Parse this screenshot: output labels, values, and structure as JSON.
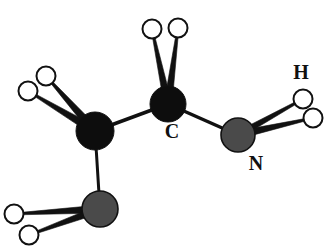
{
  "figure": {
    "kind": "molecular-structure-diagram",
    "style": "ball-and-stick",
    "background_color": "#ffffff",
    "labels_shown": [
      "C",
      "N",
      "H"
    ]
  },
  "palette": {
    "carbon_fill": "#0d0d0d",
    "nitrogen_fill": "#4a4a4a",
    "hydrogen_fill": "#ffffff",
    "outline": "#111111",
    "bond_color": "#111111",
    "label_color": "#101010"
  },
  "atoms": [
    {
      "id": "C1",
      "element": "C",
      "x": 95,
      "y": 131,
      "r": 19,
      "fill": "#0d0d0d",
      "stroke": "#111111",
      "stroke_width": 1
    },
    {
      "id": "C2",
      "element": "C",
      "x": 168,
      "y": 104,
      "r": 18,
      "fill": "#0d0d0d",
      "stroke": "#111111",
      "stroke_width": 1
    },
    {
      "id": "N1",
      "element": "N",
      "x": 238,
      "y": 135,
      "r": 17,
      "fill": "#4a4a4a",
      "stroke": "#111111",
      "stroke_width": 1.6
    },
    {
      "id": "N2",
      "element": "N",
      "x": 100,
      "y": 209,
      "r": 18,
      "fill": "#4a4a4a",
      "stroke": "#111111",
      "stroke_width": 1.6
    },
    {
      "id": "H1",
      "element": "H",
      "x": 46,
      "y": 76,
      "r": 9.5,
      "fill": "#ffffff",
      "stroke": "#111111",
      "stroke_width": 2
    },
    {
      "id": "H2",
      "element": "H",
      "x": 28,
      "y": 91,
      "r": 9.5,
      "fill": "#ffffff",
      "stroke": "#111111",
      "stroke_width": 2
    },
    {
      "id": "H3",
      "element": "H",
      "x": 152,
      "y": 29,
      "r": 9.5,
      "fill": "#ffffff",
      "stroke": "#111111",
      "stroke_width": 2
    },
    {
      "id": "H4",
      "element": "H",
      "x": 178,
      "y": 28,
      "r": 9.5,
      "fill": "#ffffff",
      "stroke": "#111111",
      "stroke_width": 2
    },
    {
      "id": "H5",
      "element": "H",
      "x": 303,
      "y": 99,
      "r": 9.5,
      "fill": "#ffffff",
      "stroke": "#111111",
      "stroke_width": 2
    },
    {
      "id": "H6",
      "element": "H",
      "x": 313,
      "y": 118,
      "r": 9.5,
      "fill": "#ffffff",
      "stroke": "#111111",
      "stroke_width": 2
    },
    {
      "id": "H7",
      "element": "H",
      "x": 14,
      "y": 214,
      "r": 9.5,
      "fill": "#ffffff",
      "stroke": "#111111",
      "stroke_width": 2
    },
    {
      "id": "H8",
      "element": "H",
      "x": 29,
      "y": 235,
      "r": 9.5,
      "fill": "#ffffff",
      "stroke": "#111111",
      "stroke_width": 2
    }
  ],
  "bonds": [
    {
      "id": "b-C1-C2",
      "from": "C1",
      "to": "C2",
      "type": "plain",
      "width": 3.5
    },
    {
      "id": "b-C2-N1",
      "from": "C2",
      "to": "N1",
      "type": "plain",
      "width": 3.5
    },
    {
      "id": "b-C1-N2",
      "from": "C1",
      "to": "N2",
      "type": "plain",
      "width": 3.0
    },
    {
      "id": "b-C1-H1",
      "from": "C1",
      "to": "H1",
      "type": "wedge",
      "width": 9
    },
    {
      "id": "b-C1-H2",
      "from": "C1",
      "to": "H2",
      "type": "wedge",
      "width": 9
    },
    {
      "id": "b-C2-H3",
      "from": "C2",
      "to": "H3",
      "type": "wedge",
      "width": 8
    },
    {
      "id": "b-C2-H4",
      "from": "C2",
      "to": "H4",
      "type": "wedge",
      "width": 8
    },
    {
      "id": "b-N1-H5",
      "from": "N1",
      "to": "H5",
      "type": "wedge",
      "width": 7
    },
    {
      "id": "b-N1-H6",
      "from": "N1",
      "to": "H6",
      "type": "wedge",
      "width": 8
    },
    {
      "id": "b-N2-H7",
      "from": "N2",
      "to": "H7",
      "type": "wedge",
      "width": 8
    },
    {
      "id": "b-N2-H8",
      "from": "N2",
      "to": "H8",
      "type": "wedge",
      "width": 8
    }
  ],
  "labels": [
    {
      "id": "label-C",
      "text": "C",
      "x": 172,
      "y": 133,
      "size": 20
    },
    {
      "id": "label-N",
      "text": "N",
      "x": 256,
      "y": 165,
      "size": 20
    },
    {
      "id": "label-H",
      "text": "H",
      "x": 301,
      "y": 74,
      "size": 20
    }
  ]
}
